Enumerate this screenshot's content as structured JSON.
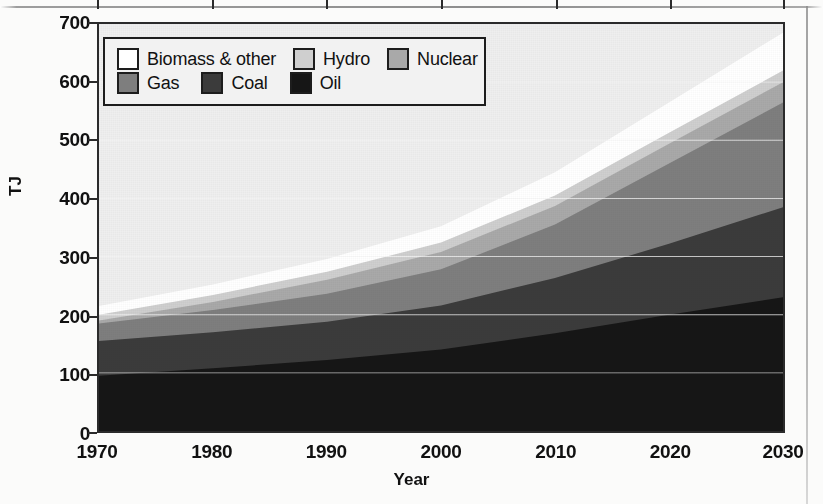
{
  "chart_data": {
    "type": "area",
    "stacked": true,
    "title": "",
    "subtitle": "",
    "xlabel": "Year",
    "ylabel": "TJ",
    "x": [
      1970,
      1980,
      1990,
      2000,
      2010,
      2020,
      2030
    ],
    "xlim": [
      1970,
      2030
    ],
    "ylim": [
      0,
      700
    ],
    "xticks": [
      "1970",
      "1980",
      "1990",
      "2000",
      "2010",
      "2020",
      "2030"
    ],
    "yticks": [
      "0",
      "100",
      "200",
      "300",
      "400",
      "500",
      "600",
      "700"
    ],
    "grid": "horizontal-light",
    "legend_position": "top-left-inside",
    "stack_order_bottom_to_top": [
      "Oil",
      "Coal",
      "Gas",
      "Nuclear",
      "Hydro",
      "Biomass & other"
    ],
    "series": [
      {
        "name": "Oil",
        "color": "#161616",
        "values": [
          95,
          108,
          122,
          140,
          168,
          200,
          230
        ]
      },
      {
        "name": "Coal",
        "color": "#3b3b3b",
        "values": [
          60,
          62,
          66,
          76,
          95,
          122,
          155
        ]
      },
      {
        "name": "Gas",
        "color": "#7e7e7e",
        "values": [
          30,
          38,
          48,
          62,
          92,
          138,
          180
        ]
      },
      {
        "name": "Nuclear",
        "color": "#a9a9a9",
        "values": [
          5,
          14,
          24,
          30,
          32,
          34,
          35
        ]
      },
      {
        "name": "Hydro",
        "color": "#cfcfcf",
        "values": [
          10,
          12,
          14,
          16,
          18,
          19,
          20
        ]
      },
      {
        "name": "Biomass & other",
        "color": "#ffffff",
        "values": [
          15,
          18,
          22,
          28,
          40,
          52,
          65
        ]
      }
    ],
    "cumulative_tops": {
      "Oil": [
        95,
        108,
        122,
        140,
        168,
        200,
        230
      ],
      "Coal": [
        155,
        170,
        188,
        216,
        263,
        322,
        385
      ],
      "Gas": [
        185,
        208,
        236,
        278,
        355,
        460,
        565
      ],
      "Nuclear": [
        190,
        222,
        260,
        308,
        387,
        494,
        600
      ],
      "Hydro": [
        200,
        234,
        274,
        324,
        405,
        513,
        620
      ],
      "Biomass & other": [
        215,
        252,
        296,
        352,
        445,
        565,
        685
      ]
    },
    "total": [
      215,
      252,
      296,
      352,
      445,
      565,
      685
    ]
  },
  "legend": {
    "rows": [
      [
        {
          "label": "Biomass & other",
          "color": "#ffffff"
        },
        {
          "label": "Hydro",
          "color": "#cfcfcf"
        },
        {
          "label": "Nuclear",
          "color": "#a9a9a9"
        }
      ],
      [
        {
          "label": "Gas",
          "color": "#7e7e7e"
        },
        {
          "label": "Coal",
          "color": "#3b3b3b"
        },
        {
          "label": "Oil",
          "color": "#161616"
        }
      ]
    ]
  },
  "axes": {
    "y_title": "TJ",
    "x_title": "Year",
    "y_tick_labels": [
      "700",
      "600",
      "500",
      "400",
      "300",
      "200",
      "100",
      "0"
    ],
    "x_tick_labels": [
      "1970",
      "1980",
      "1990",
      "2000",
      "2010",
      "2020",
      "2030"
    ]
  },
  "colors": {
    "plot_background": "#efefef",
    "axis_line": "#2b2b2b",
    "gridline": "#f6f6f6",
    "page_background": "#fbfbfa"
  }
}
